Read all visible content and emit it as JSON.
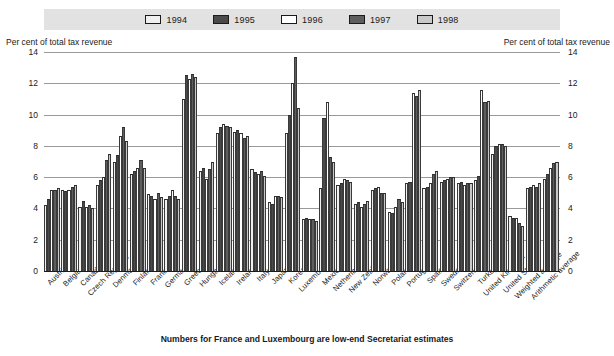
{
  "legend": {
    "items": [
      {
        "label": "1994",
        "color": "#efefef"
      },
      {
        "label": "1995",
        "color": "#4a4a4a"
      },
      {
        "label": "1996",
        "color": "#ffffff"
      },
      {
        "label": "1997",
        "color": "#5e5e5e"
      },
      {
        "label": "1998",
        "color": "#c9c9c9"
      }
    ]
  },
  "axis": {
    "left_caption": "Per cent of total tax revenue",
    "right_caption": "Per cent of total tax revenue",
    "ticks": [
      "14",
      "12",
      "10",
      "8",
      "6",
      "4",
      "2",
      "0"
    ]
  },
  "footnote": "Numbers for France and Luxembourg are low-end Secretariat estimates",
  "chart_data": {
    "type": "bar",
    "title": "",
    "xlabel": "",
    "ylabel": "Per cent of total tax revenue",
    "ylim": [
      0,
      14
    ],
    "yticks": [
      0,
      2,
      4,
      6,
      8,
      10,
      12,
      14
    ],
    "grid": true,
    "legend_position": "top",
    "categories": [
      "Austria",
      "Belgium",
      "Canada",
      "Czech Republic",
      "Denmark",
      "Finland",
      "France",
      "Germany",
      "Greece",
      "Hungary",
      "Iceland",
      "Ireland",
      "Italy",
      "Japan",
      "Korea",
      "Luxembourg",
      "Mexico",
      "Netherlands",
      "New Zealand",
      "Norway",
      "Poland",
      "Portugal",
      "Spain",
      "Sweden",
      "Switzerland",
      "Turkey",
      "United Kingdom",
      "United States",
      "Weighted average",
      "Arithmetic average"
    ],
    "series": [
      {
        "name": "1994",
        "values": [
          4.2,
          5.2,
          4.1,
          5.5,
          7.0,
          6.2,
          4.9,
          4.6,
          11.0,
          6.4,
          8.8,
          8.9,
          6.5,
          4.4,
          8.8,
          3.3,
          5.3,
          5.5,
          4.3,
          5.2,
          3.8,
          5.6,
          5.3,
          5.7,
          5.6,
          5.8,
          7.5,
          3.5,
          5.3,
          5.9
        ]
      },
      {
        "name": "1995",
        "values": [
          4.6,
          5.1,
          4.5,
          5.8,
          7.4,
          6.4,
          4.8,
          4.8,
          12.5,
          6.6,
          9.2,
          9.0,
          6.3,
          4.3,
          10.0,
          3.4,
          9.8,
          5.6,
          4.4,
          5.3,
          3.7,
          5.7,
          5.4,
          5.8,
          5.7,
          6.1,
          8.0,
          3.4,
          5.4,
          6.2
        ]
      },
      {
        "name": "1996",
        "values": [
          5.2,
          5.2,
          4.1,
          6.0,
          8.6,
          6.6,
          4.6,
          5.2,
          12.3,
          5.9,
          9.4,
          8.8,
          6.2,
          4.8,
          12.0,
          3.3,
          10.8,
          5.9,
          4.1,
          5.4,
          4.1,
          11.4,
          5.6,
          5.9,
          5.5,
          11.6,
          8.1,
          3.4,
          5.5,
          6.6
        ]
      },
      {
        "name": "1997",
        "values": [
          5.2,
          5.4,
          4.2,
          7.1,
          9.2,
          7.1,
          5.0,
          4.8,
          12.6,
          6.5,
          9.3,
          8.5,
          6.4,
          4.8,
          13.7,
          3.3,
          7.3,
          5.8,
          4.3,
          5.0,
          4.6,
          11.2,
          6.2,
          6.0,
          5.6,
          10.8,
          8.1,
          3.1,
          5.4,
          6.9
        ]
      },
      {
        "name": "1998",
        "values": [
          5.3,
          5.5,
          4.0,
          7.5,
          8.3,
          6.6,
          4.7,
          4.6,
          12.4,
          7.0,
          9.2,
          8.6,
          6.1,
          4.7,
          10.4,
          3.2,
          7.0,
          5.7,
          4.5,
          5.0,
          4.4,
          11.6,
          6.4,
          6.0,
          5.6,
          10.9,
          8.0,
          2.9,
          5.6,
          7.0
        ]
      }
    ]
  }
}
